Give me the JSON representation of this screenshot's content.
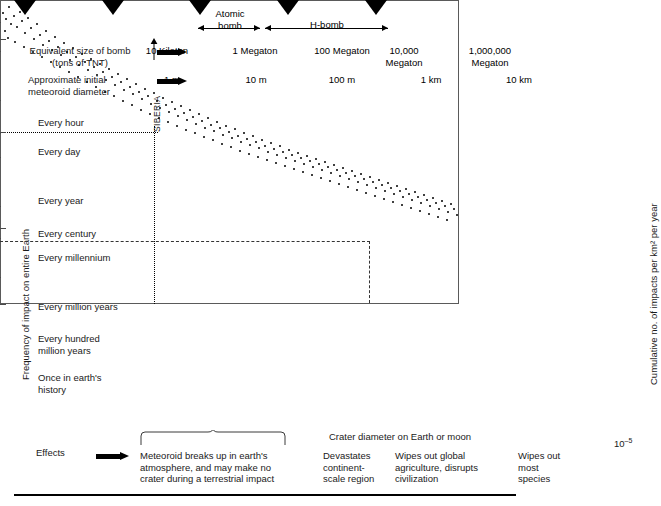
{
  "figure": {
    "title_hidden": "",
    "row_labels": {
      "bomb_size": "Equivalent size of bomb\n(tons of TNT)",
      "meteoroid": "Approximate initial\nmeteoroid diameter",
      "effects": "Effects"
    },
    "ranges": [
      {
        "name": "atomic-bomb-range",
        "label": "Atomic\nbomb"
      },
      {
        "name": "h-bomb-range",
        "label": "H-bomb"
      }
    ],
    "bomb_scale": [
      {
        "label": "10\nKiloton",
        "x": 167
      },
      {
        "label": "1\nMegaton",
        "x": 255
      },
      {
        "label": "100\nMegaton",
        "x": 342
      },
      {
        "label": "10,000\nMegaton",
        "x": 404
      },
      {
        "label": "1,000,000\nMegaton",
        "x": 490
      }
    ],
    "meteoroid_scale": [
      {
        "label": "1 m",
        "x": 167
      },
      {
        "label": "10 m",
        "x": 255
      },
      {
        "label": "100 m",
        "x": 342
      },
      {
        "label": "1 km",
        "x": 430
      },
      {
        "label": "10 km",
        "x": 518
      }
    ],
    "effects": [
      {
        "name": "effect-breakup",
        "text": "Meteoroid breaks up in earth's\natmosphere, and may make no\ncrater during a terrestrial impact"
      },
      {
        "name": "effect-continent",
        "text": "Devastates\ncontinent-\nscale region"
      },
      {
        "name": "effect-agriculture",
        "text": "Wipes out global\nagriculture, disrupts\ncivilization"
      },
      {
        "name": "effect-species",
        "text": "Wipes out\nmost\nspecies"
      }
    ],
    "annotations": [
      {
        "name": "siberia-annotation",
        "label": "SIBERIA"
      }
    ]
  },
  "chart_data": {
    "type": "scatter",
    "title": "",
    "xlabel": "Crater diameter on Earth or moon",
    "ylabel_left": "Frequency of impact on entire Earth",
    "ylabel_right": "Cumulative no. of impacts per km² per year",
    "grid": false,
    "legend_position": "none",
    "x_ticks": [
      {
        "label": "(10 m)",
        "px": 170
      },
      {
        "label": "(100 m)",
        "px": 255
      },
      {
        "label": "1 km",
        "px": 340
      },
      {
        "label": "10 km",
        "px": 425
      },
      {
        "label": "100 km",
        "px": 511
      },
      {
        "label": "1000 km",
        "px": 600
      }
    ],
    "y_ticks_right": [
      {
        "label": "10",
        "exp": "–5",
        "px": 140
      },
      {
        "label": "10",
        "exp": "–10",
        "px": 233
      },
      {
        "label": "10",
        "exp": "–15",
        "px": 329
      },
      {
        "label": "10",
        "exp": "–20",
        "px": 405
      }
    ],
    "y_ticks_left": [
      {
        "label": "Every hour",
        "px": 123
      },
      {
        "label": "Every day",
        "px": 152
      },
      {
        "label": "Every year",
        "px": 201
      },
      {
        "label": "Every century",
        "px": 234
      },
      {
        "label": "Every millennium",
        "px": 258
      },
      {
        "label": "Every million years",
        "px": 307
      },
      {
        "label": "Every hundred\nmillion years",
        "px": 339
      },
      {
        "label": "Once in earth's\nhistory",
        "px": 378
      }
    ],
    "guides": [
      {
        "name": "century-dotted-horizontal",
        "style": "dotted",
        "orient": "h",
        "y": 234,
        "x0": 142,
        "x1": 300
      },
      {
        "name": "siberia-dotted-vertical",
        "style": "dotted",
        "orient": "v",
        "x": 296,
        "y0": 228,
        "y1": 405
      },
      {
        "name": "hundred-million-dashed-horizontal",
        "style": "dashed",
        "orient": "h",
        "y": 343,
        "x0": 142,
        "x1": 512
      },
      {
        "name": "hundredkm-dashed-vertical",
        "style": "dashed",
        "orient": "v",
        "x": 511,
        "y0": 343,
        "y1": 405
      }
    ],
    "points": [
      [
        144,
        113
      ],
      [
        147,
        119
      ],
      [
        150,
        107
      ],
      [
        152,
        124
      ],
      [
        146,
        131
      ],
      [
        155,
        116
      ],
      [
        158,
        127
      ],
      [
        161,
        112
      ],
      [
        149,
        138
      ],
      [
        163,
        121
      ],
      [
        166,
        133
      ],
      [
        156,
        142
      ],
      [
        169,
        118
      ],
      [
        172,
        128
      ],
      [
        175,
        139
      ],
      [
        165,
        147
      ],
      [
        178,
        124
      ],
      [
        181,
        135
      ],
      [
        184,
        145
      ],
      [
        174,
        152
      ],
      [
        187,
        131
      ],
      [
        190,
        141
      ],
      [
        193,
        150
      ],
      [
        183,
        157
      ],
      [
        196,
        137
      ],
      [
        199,
        147
      ],
      [
        202,
        155
      ],
      [
        192,
        162
      ],
      [
        205,
        143
      ],
      [
        208,
        152
      ],
      [
        211,
        160
      ],
      [
        201,
        167
      ],
      [
        214,
        148
      ],
      [
        217,
        157
      ],
      [
        220,
        165
      ],
      [
        210,
        172
      ],
      [
        223,
        154
      ],
      [
        226,
        162
      ],
      [
        229,
        170
      ],
      [
        219,
        177
      ],
      [
        232,
        159
      ],
      [
        235,
        167
      ],
      [
        238,
        175
      ],
      [
        228,
        182
      ],
      [
        241,
        164
      ],
      [
        244,
        172
      ],
      [
        247,
        180
      ],
      [
        237,
        187
      ],
      [
        250,
        169
      ],
      [
        253,
        177
      ],
      [
        256,
        185
      ],
      [
        246,
        192
      ],
      [
        259,
        174
      ],
      [
        262,
        182
      ],
      [
        265,
        190
      ],
      [
        255,
        196
      ],
      [
        268,
        179
      ],
      [
        271,
        187
      ],
      [
        274,
        194
      ],
      [
        264,
        201
      ],
      [
        277,
        184
      ],
      [
        280,
        192
      ],
      [
        283,
        199
      ],
      [
        273,
        205
      ],
      [
        286,
        189
      ],
      [
        289,
        196
      ],
      [
        292,
        204
      ],
      [
        282,
        210
      ],
      [
        295,
        193
      ],
      [
        298,
        201
      ],
      [
        301,
        208
      ],
      [
        291,
        214
      ],
      [
        304,
        198
      ],
      [
        307,
        205
      ],
      [
        310,
        212
      ],
      [
        300,
        218
      ],
      [
        313,
        202
      ],
      [
        316,
        209
      ],
      [
        319,
        216
      ],
      [
        309,
        222
      ],
      [
        322,
        206
      ],
      [
        325,
        213
      ],
      [
        328,
        220
      ],
      [
        318,
        226
      ],
      [
        331,
        210
      ],
      [
        334,
        217
      ],
      [
        337,
        224
      ],
      [
        327,
        230
      ],
      [
        340,
        214
      ],
      [
        343,
        221
      ],
      [
        346,
        228
      ],
      [
        336,
        233
      ],
      [
        349,
        218
      ],
      [
        352,
        225
      ],
      [
        355,
        231
      ],
      [
        345,
        237
      ],
      [
        358,
        222
      ],
      [
        361,
        228
      ],
      [
        364,
        235
      ],
      [
        354,
        240
      ],
      [
        367,
        226
      ],
      [
        370,
        232
      ],
      [
        373,
        238
      ],
      [
        363,
        244
      ],
      [
        376,
        229
      ],
      [
        379,
        236
      ],
      [
        382,
        242
      ],
      [
        372,
        247
      ],
      [
        385,
        233
      ],
      [
        388,
        239
      ],
      [
        391,
        245
      ],
      [
        381,
        251
      ],
      [
        394,
        236
      ],
      [
        397,
        242
      ],
      [
        400,
        248
      ],
      [
        390,
        254
      ],
      [
        403,
        240
      ],
      [
        406,
        246
      ],
      [
        409,
        252
      ],
      [
        399,
        257
      ],
      [
        412,
        243
      ],
      [
        415,
        249
      ],
      [
        418,
        255
      ],
      [
        408,
        260
      ],
      [
        421,
        246
      ],
      [
        424,
        252
      ],
      [
        427,
        258
      ],
      [
        417,
        263
      ],
      [
        430,
        250
      ],
      [
        433,
        255
      ],
      [
        436,
        261
      ],
      [
        426,
        266
      ],
      [
        439,
        253
      ],
      [
        442,
        258
      ],
      [
        445,
        264
      ],
      [
        435,
        269
      ],
      [
        448,
        256
      ],
      [
        451,
        261
      ],
      [
        454,
        267
      ],
      [
        444,
        272
      ],
      [
        457,
        259
      ],
      [
        460,
        264
      ],
      [
        463,
        270
      ],
      [
        453,
        275
      ],
      [
        466,
        262
      ],
      [
        469,
        267
      ],
      [
        472,
        273
      ],
      [
        462,
        278
      ],
      [
        475,
        265
      ],
      [
        478,
        270
      ],
      [
        481,
        276
      ],
      [
        471,
        281
      ],
      [
        484,
        268
      ],
      [
        487,
        273
      ],
      [
        490,
        279
      ],
      [
        480,
        284
      ],
      [
        493,
        271
      ],
      [
        496,
        276
      ],
      [
        499,
        282
      ],
      [
        489,
        287
      ],
      [
        502,
        274
      ],
      [
        505,
        279
      ],
      [
        508,
        285
      ],
      [
        498,
        290
      ],
      [
        511,
        277
      ],
      [
        514,
        282
      ],
      [
        517,
        288
      ],
      [
        507,
        293
      ],
      [
        520,
        280
      ],
      [
        523,
        285
      ],
      [
        526,
        291
      ],
      [
        516,
        296
      ],
      [
        529,
        283
      ],
      [
        532,
        288
      ],
      [
        535,
        294
      ],
      [
        525,
        299
      ],
      [
        538,
        286
      ],
      [
        541,
        291
      ],
      [
        544,
        297
      ],
      [
        534,
        302
      ],
      [
        547,
        289
      ],
      [
        550,
        294
      ],
      [
        553,
        300
      ],
      [
        543,
        305
      ],
      [
        556,
        292
      ],
      [
        559,
        297
      ],
      [
        562,
        303
      ],
      [
        552,
        308
      ],
      [
        565,
        295
      ],
      [
        568,
        300
      ],
      [
        571,
        306
      ],
      [
        561,
        311
      ],
      [
        574,
        298
      ],
      [
        577,
        303
      ],
      [
        580,
        309
      ],
      [
        570,
        314
      ],
      [
        583,
        301
      ],
      [
        586,
        306
      ],
      [
        589,
        312
      ],
      [
        579,
        317
      ],
      [
        592,
        304
      ],
      [
        595,
        309
      ],
      [
        598,
        315
      ],
      [
        588,
        320
      ]
    ]
  }
}
